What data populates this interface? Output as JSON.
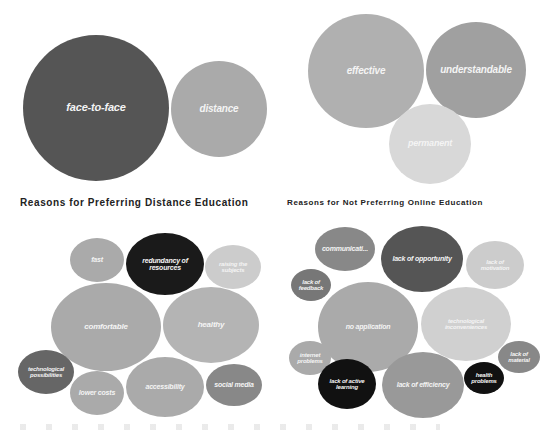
{
  "chart_data": [
    {
      "type": "bubble",
      "title": "",
      "position": "top-left",
      "bubbles": [
        {
          "label": "face-to-face",
          "cx": 96,
          "cy": 108,
          "rx": 73,
          "ry": 73,
          "color": "#555555",
          "fs": 11
        },
        {
          "label": "distance",
          "cx": 219,
          "cy": 109,
          "rx": 48,
          "ry": 48,
          "color": "#aaaaaa",
          "fs": 10
        }
      ]
    },
    {
      "type": "bubble",
      "title": "",
      "position": "top-right",
      "bubbles": [
        {
          "label": "effective",
          "cx": 366,
          "cy": 71,
          "rx": 58,
          "ry": 57,
          "color": "#b0b0b0",
          "fs": 10
        },
        {
          "label": "understandable",
          "cx": 476,
          "cy": 70,
          "rx": 50,
          "ry": 48,
          "color": "#a0a0a0",
          "fs": 10
        },
        {
          "label": "permanent",
          "cx": 430,
          "cy": 144,
          "rx": 41,
          "ry": 40,
          "color": "#d8d8d8",
          "fs": 9
        }
      ]
    },
    {
      "type": "bubble",
      "title": "Reasons for Preferring Distance Education",
      "position": "bottom-left",
      "bubbles": [
        {
          "label": "fast",
          "cx": 97,
          "cy": 260,
          "rx": 27,
          "ry": 22,
          "color": "#aaaaaa",
          "fs": 7
        },
        {
          "label": "redundancy of resources",
          "cx": 165,
          "cy": 264,
          "rx": 39,
          "ry": 31,
          "color": "#1a1a1a",
          "fs": 7
        },
        {
          "label": "raising the subjects",
          "cx": 233,
          "cy": 267,
          "rx": 28,
          "ry": 22,
          "color": "#cccccc",
          "fs": 6
        },
        {
          "label": "comfortable",
          "cx": 106,
          "cy": 327,
          "rx": 55,
          "ry": 44,
          "color": "#aaaaaa",
          "fs": 8
        },
        {
          "label": "healthy",
          "cx": 211,
          "cy": 325,
          "rx": 48,
          "ry": 38,
          "color": "#b4b4b4",
          "fs": 8
        },
        {
          "label": "technological possibilities",
          "cx": 46,
          "cy": 372,
          "rx": 28,
          "ry": 22,
          "color": "#666666",
          "fs": 6
        },
        {
          "label": "lower costs",
          "cx": 97,
          "cy": 393,
          "rx": 27,
          "ry": 22,
          "color": "#aaaaaa",
          "fs": 7
        },
        {
          "label": "accessibility",
          "cx": 165,
          "cy": 387,
          "rx": 39,
          "ry": 30,
          "color": "#aaaaaa",
          "fs": 7
        },
        {
          "label": "social media",
          "cx": 234,
          "cy": 385,
          "rx": 28,
          "ry": 21,
          "color": "#888888",
          "fs": 7
        }
      ]
    },
    {
      "type": "bubble",
      "title": "Reasons for Not Preferring Online Education",
      "position": "bottom-right",
      "bubbles": [
        {
          "label": "communicati...",
          "cx": 345,
          "cy": 249,
          "rx": 30,
          "ry": 22,
          "color": "#888888",
          "fs": 7
        },
        {
          "label": "lack of opportunity",
          "cx": 422,
          "cy": 259,
          "rx": 41,
          "ry": 33,
          "color": "#555555",
          "fs": 7
        },
        {
          "label": "lack of motivation",
          "cx": 495,
          "cy": 265,
          "rx": 29,
          "ry": 24,
          "color": "#cccccc",
          "fs": 6
        },
        {
          "label": "lack of feedback",
          "cx": 311,
          "cy": 285,
          "rx": 20,
          "ry": 16,
          "color": "#777777",
          "fs": 6
        },
        {
          "label": "no application",
          "cx": 368,
          "cy": 327,
          "rx": 50,
          "ry": 45,
          "color": "#aaaaaa",
          "fs": 7
        },
        {
          "label": "technological inconveniences",
          "cx": 466,
          "cy": 324,
          "rx": 45,
          "ry": 37,
          "color": "#d0d0d0",
          "fs": 6
        },
        {
          "label": "internet problems",
          "cx": 310,
          "cy": 358,
          "rx": 21,
          "ry": 17,
          "color": "#aaaaaa",
          "fs": 6
        },
        {
          "label": "lack of material",
          "cx": 519,
          "cy": 357,
          "rx": 21,
          "ry": 16,
          "color": "#888888",
          "fs": 6
        },
        {
          "label": "health problems",
          "cx": 484,
          "cy": 378,
          "rx": 20,
          "ry": 16,
          "color": "#111111",
          "fs": 6
        },
        {
          "label": "lack of active learning",
          "cx": 347,
          "cy": 384,
          "rx": 29,
          "ry": 25,
          "color": "#111111",
          "fs": 6
        },
        {
          "label": "lack of efficiency",
          "cx": 423,
          "cy": 385,
          "rx": 41,
          "ry": 33,
          "color": "#999999",
          "fs": 7
        }
      ]
    }
  ],
  "titles": {
    "left": "Reasons for Preferring Distance Education",
    "right": "Reasons for Not Preferring Online Education"
  }
}
